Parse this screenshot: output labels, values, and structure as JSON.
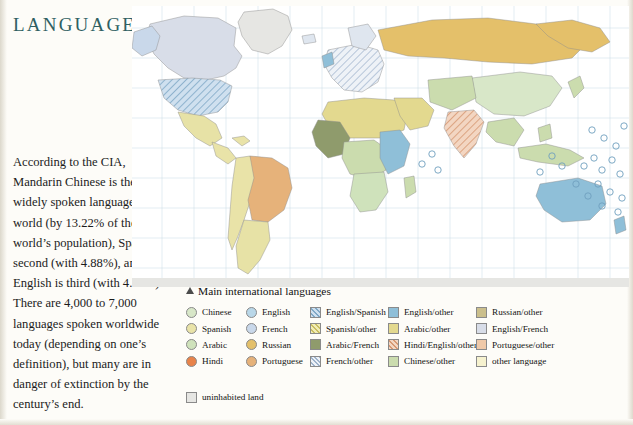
{
  "page": {
    "title": "LANGUAGE",
    "body_text": "According to the CIA, Mandarin Chinese is the most widely spoken language in the world (by 13.22% of the world’s population), Spanish is second (with 4.88%), and English is third (with 4.68%). There are 4,000 to 7,000 languages spoken worldwide today (depending on  one’s definition), but many are in danger of extinction by the century’s end."
  },
  "legend": {
    "title": "Main international languages",
    "marker_icon": "triangle-up-icon",
    "columns": [
      {
        "left": 0,
        "items": [
          {
            "label": "Chinese",
            "color": "#d8e7c8",
            "shape": "round",
            "pattern": "none"
          },
          {
            "label": "Spanish",
            "color": "#e9e3a8",
            "shape": "round",
            "pattern": "none"
          },
          {
            "label": "Arabic",
            "color": "#cfe2bb",
            "shape": "round",
            "pattern": "none"
          },
          {
            "label": "Hindi",
            "color": "#e8834a",
            "shape": "round",
            "pattern": "none"
          }
        ]
      },
      {
        "left": 60,
        "items": [
          {
            "label": "English",
            "color": "#b9d7e8",
            "shape": "round",
            "pattern": "none"
          },
          {
            "label": "French",
            "color": "#c9d8ea",
            "shape": "round",
            "pattern": "none"
          },
          {
            "label": "Russian",
            "color": "#e4c06a",
            "shape": "round",
            "pattern": "none"
          },
          {
            "label": "Portuguese",
            "color": "#e6b27a",
            "shape": "round",
            "pattern": "none"
          }
        ]
      },
      {
        "left": 124,
        "items": [
          {
            "label": "English/Spanish",
            "color": "#cfe0ef",
            "shape": "square",
            "pattern": "diagonal"
          },
          {
            "label": "Spanish/other",
            "color": "#e7e2a6",
            "shape": "square",
            "pattern": "diagonal"
          },
          {
            "label": "Arabic/French",
            "color": "#8f9b6c",
            "shape": "square",
            "pattern": "none"
          },
          {
            "label": "French/other",
            "color": "#dfe6ef",
            "shape": "square",
            "pattern": "diagonal"
          }
        ]
      },
      {
        "left": 202,
        "items": [
          {
            "label": "English/other",
            "color": "#8fbfd8",
            "shape": "square",
            "pattern": "none"
          },
          {
            "label": "Arabic/other",
            "color": "#e3d98f",
            "shape": "square",
            "pattern": "none"
          },
          {
            "label": "Hindi/English/other",
            "color": "#e9b89a",
            "shape": "square",
            "pattern": "diagonal"
          },
          {
            "label": "Chinese/other",
            "color": "#cbdcae",
            "shape": "square",
            "pattern": "none"
          }
        ]
      },
      {
        "left": 290,
        "items": [
          {
            "label": "Russian/other",
            "color": "#cbbf8c",
            "shape": "square",
            "pattern": "none"
          },
          {
            "label": "English/French",
            "color": "#d8dde8",
            "shape": "square",
            "pattern": "none"
          },
          {
            "label": "Portuguese/other",
            "color": "#f0c9a8",
            "shape": "square",
            "pattern": "none"
          },
          {
            "label": "other language",
            "color": "#f6f2cf",
            "shape": "square",
            "pattern": "none"
          }
        ]
      }
    ],
    "uninhabited": {
      "label": "uninhabited land",
      "color": "#e6e6e3",
      "shape": "square",
      "pattern": "none"
    }
  },
  "map": {
    "name": "world-language-map",
    "ocean_color": "#ffffff",
    "graticule_color": "#bcd5e0",
    "regions": [
      {
        "name": "greenland",
        "color": "#e6e6e3"
      },
      {
        "name": "canada",
        "color": "#d8dde8"
      },
      {
        "name": "alaska",
        "color": "#c9d8ea"
      },
      {
        "name": "united-states",
        "color": "#cfe0ef"
      },
      {
        "name": "mexico",
        "color": "#e7e2a6"
      },
      {
        "name": "central-america",
        "color": "#e9e3a8"
      },
      {
        "name": "brazil",
        "color": "#e6b27a"
      },
      {
        "name": "argentina",
        "color": "#e7e2a6"
      },
      {
        "name": "andes",
        "color": "#e9e3a8"
      },
      {
        "name": "north-africa",
        "color": "#e3d98f"
      },
      {
        "name": "west-africa",
        "color": "#8f9b6c"
      },
      {
        "name": "central-africa",
        "color": "#cbdcae"
      },
      {
        "name": "east-africa",
        "color": "#8fbfd8"
      },
      {
        "name": "southern-africa",
        "color": "#cfe2bb"
      },
      {
        "name": "europe",
        "color": "#dfe6ef"
      },
      {
        "name": "russia",
        "color": "#e4c06a"
      },
      {
        "name": "middle-east",
        "color": "#e3d98f"
      },
      {
        "name": "india",
        "color": "#e9b89a"
      },
      {
        "name": "china",
        "color": "#d8e7c8"
      },
      {
        "name": "southeast-asia",
        "color": "#cbdcae"
      },
      {
        "name": "australia",
        "color": "#8fbfd8"
      },
      {
        "name": "antarctica",
        "color": "#e6e6e3"
      }
    ]
  }
}
